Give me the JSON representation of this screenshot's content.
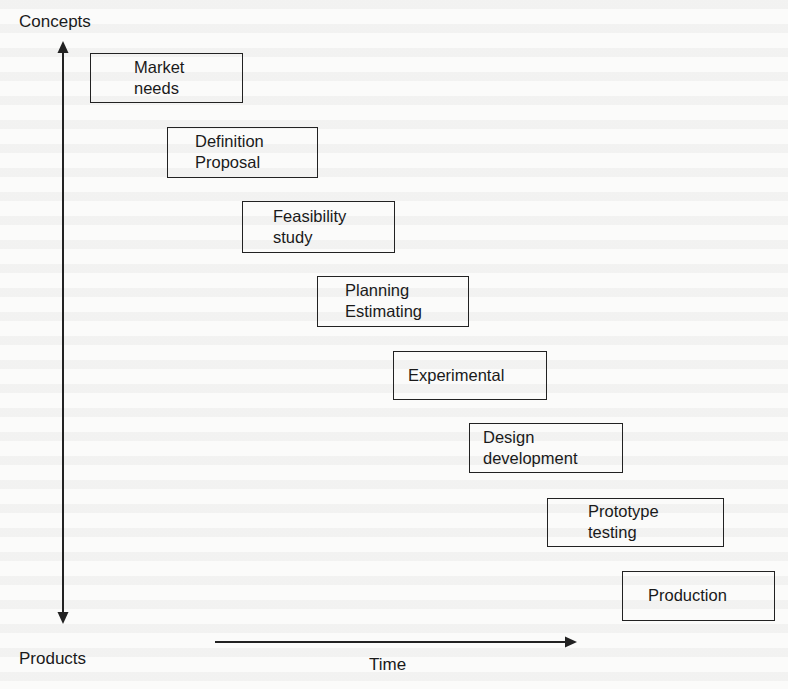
{
  "diagram": {
    "type": "staircase-process",
    "vertical_axis": {
      "top_label": "Concepts",
      "bottom_label": "Products"
    },
    "horizontal_axis": {
      "label": "Time"
    },
    "stages": [
      {
        "id": "market-needs",
        "lines": [
          "Market",
          "needs"
        ]
      },
      {
        "id": "definition-proposal",
        "lines": [
          "Definition",
          "Proposal"
        ]
      },
      {
        "id": "feasibility-study",
        "lines": [
          "Feasibility",
          "study"
        ]
      },
      {
        "id": "planning-estimating",
        "lines": [
          "Planning",
          "Estimating"
        ]
      },
      {
        "id": "experimental",
        "lines": [
          "Experimental"
        ]
      },
      {
        "id": "design-development",
        "lines": [
          "Design",
          "development"
        ]
      },
      {
        "id": "prototype-testing",
        "lines": [
          "Prototype",
          "testing"
        ]
      },
      {
        "id": "production",
        "lines": [
          "Production"
        ]
      }
    ],
    "colors": {
      "ink": "#222222",
      "paper": "#fbfbfa"
    }
  }
}
